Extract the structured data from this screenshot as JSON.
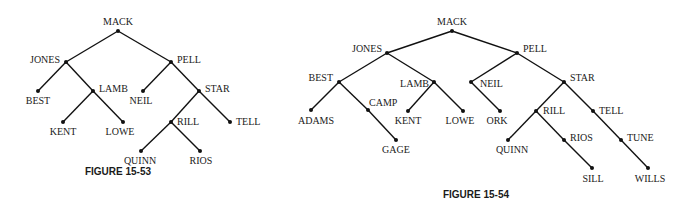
{
  "figures": [
    {
      "caption": "FIGURE 15-53",
      "caption_pos": [
        118,
        175
      ],
      "nodes": [
        {
          "id": "MACK",
          "x": 118,
          "y": 31,
          "lx": 118,
          "ly": 25,
          "anchor": "middle"
        },
        {
          "id": "JONES",
          "x": 66,
          "y": 62,
          "lx": 60,
          "ly": 63,
          "anchor": "end"
        },
        {
          "id": "PELL",
          "x": 171,
          "y": 62,
          "lx": 177,
          "ly": 63,
          "anchor": "start"
        },
        {
          "id": "BEST",
          "x": 38,
          "y": 91,
          "lx": 38,
          "ly": 104,
          "anchor": "middle"
        },
        {
          "id": "LAMB",
          "x": 93,
          "y": 91,
          "lx": 99,
          "ly": 92,
          "anchor": "start"
        },
        {
          "id": "NEIL",
          "x": 143,
          "y": 91,
          "lx": 141,
          "ly": 104,
          "anchor": "middle"
        },
        {
          "id": "STAR",
          "x": 199,
          "y": 91,
          "lx": 205,
          "ly": 92,
          "anchor": "start"
        },
        {
          "id": "KENT",
          "x": 63,
          "y": 122,
          "lx": 63,
          "ly": 135,
          "anchor": "middle"
        },
        {
          "id": "LOWE",
          "x": 123,
          "y": 122,
          "lx": 120,
          "ly": 135,
          "anchor": "middle"
        },
        {
          "id": "RILL",
          "x": 171,
          "y": 122,
          "lx": 177,
          "ly": 125,
          "anchor": "start"
        },
        {
          "id": "TELL",
          "x": 230,
          "y": 122,
          "lx": 236,
          "ly": 125,
          "anchor": "start"
        },
        {
          "id": "QUINN",
          "x": 141,
          "y": 151,
          "lx": 140,
          "ly": 164,
          "anchor": "middle"
        },
        {
          "id": "RIOS",
          "x": 200,
          "y": 151,
          "lx": 201,
          "ly": 164,
          "anchor": "middle"
        }
      ],
      "edges": [
        [
          "MACK",
          "JONES"
        ],
        [
          "MACK",
          "PELL"
        ],
        [
          "JONES",
          "BEST"
        ],
        [
          "JONES",
          "LAMB"
        ],
        [
          "LAMB",
          "KENT"
        ],
        [
          "LAMB",
          "LOWE"
        ],
        [
          "PELL",
          "NEIL"
        ],
        [
          "PELL",
          "STAR"
        ],
        [
          "STAR",
          "RILL"
        ],
        [
          "STAR",
          "TELL"
        ],
        [
          "RILL",
          "QUINN"
        ],
        [
          "RILL",
          "RIOS"
        ]
      ]
    },
    {
      "caption": "FIGURE 15-54",
      "caption_pos": [
        476,
        198
      ],
      "nodes": [
        {
          "id": "MACK",
          "x": 452,
          "y": 31,
          "lx": 452,
          "ly": 25,
          "anchor": "middle"
        },
        {
          "id": "JONES",
          "x": 387,
          "y": 53,
          "lx": 382,
          "ly": 52,
          "anchor": "end"
        },
        {
          "id": "PELL",
          "x": 517,
          "y": 53,
          "lx": 523,
          "ly": 52,
          "anchor": "start"
        },
        {
          "id": "BEST",
          "x": 339,
          "y": 82,
          "lx": 333,
          "ly": 81,
          "anchor": "end"
        },
        {
          "id": "LAMB",
          "x": 434,
          "y": 82,
          "lx": 429,
          "ly": 87,
          "anchor": "end"
        },
        {
          "id": "NEIL",
          "x": 471,
          "y": 82,
          "lx": 480,
          "ly": 87,
          "anchor": "start"
        },
        {
          "id": "STAR",
          "x": 564,
          "y": 82,
          "lx": 570,
          "ly": 81,
          "anchor": "start"
        },
        {
          "id": "ADAMS",
          "x": 311,
          "y": 110,
          "lx": 316,
          "ly": 124,
          "anchor": "middle"
        },
        {
          "id": "CAMP",
          "x": 368,
          "y": 110,
          "lx": 369,
          "ly": 106,
          "anchor": "start"
        },
        {
          "id": "KENT",
          "x": 408,
          "y": 111,
          "lx": 408,
          "ly": 124,
          "anchor": "middle"
        },
        {
          "id": "LOWE",
          "x": 463,
          "y": 111,
          "lx": 460,
          "ly": 124,
          "anchor": "middle"
        },
        {
          "id": "ORK",
          "x": 500,
          "y": 111,
          "lx": 497,
          "ly": 124,
          "anchor": "middle"
        },
        {
          "id": "RILL",
          "x": 536,
          "y": 111,
          "lx": 543,
          "ly": 114,
          "anchor": "start"
        },
        {
          "id": "TELL",
          "x": 593,
          "y": 111,
          "lx": 599,
          "ly": 114,
          "anchor": "start"
        },
        {
          "id": "GAGE",
          "x": 396,
          "y": 140,
          "lx": 396,
          "ly": 153,
          "anchor": "middle"
        },
        {
          "id": "QUINN",
          "x": 508,
          "y": 140,
          "lx": 512,
          "ly": 153,
          "anchor": "middle"
        },
        {
          "id": "RIOS",
          "x": 564,
          "y": 140,
          "lx": 570,
          "ly": 141,
          "anchor": "start"
        },
        {
          "id": "TUNE",
          "x": 621,
          "y": 140,
          "lx": 627,
          "ly": 141,
          "anchor": "start"
        },
        {
          "id": "SILL",
          "x": 592,
          "y": 168,
          "lx": 593,
          "ly": 182,
          "anchor": "middle"
        },
        {
          "id": "WILLS",
          "x": 648,
          "y": 168,
          "lx": 650,
          "ly": 182,
          "anchor": "middle"
        }
      ],
      "edges": [
        [
          "MACK",
          "JONES"
        ],
        [
          "MACK",
          "PELL"
        ],
        [
          "JONES",
          "BEST"
        ],
        [
          "JONES",
          "LAMB"
        ],
        [
          "BEST",
          "ADAMS"
        ],
        [
          "BEST",
          "CAMP"
        ],
        [
          "CAMP",
          "GAGE"
        ],
        [
          "LAMB",
          "KENT"
        ],
        [
          "LAMB",
          "LOWE"
        ],
        [
          "PELL",
          "NEIL"
        ],
        [
          "PELL",
          "STAR"
        ],
        [
          "NEIL",
          "ORK"
        ],
        [
          "STAR",
          "RILL"
        ],
        [
          "STAR",
          "TELL"
        ],
        [
          "RILL",
          "QUINN"
        ],
        [
          "RILL",
          "RIOS"
        ],
        [
          "RIOS",
          "SILL"
        ],
        [
          "TELL",
          "TUNE"
        ],
        [
          "TUNE",
          "WILLS"
        ]
      ]
    }
  ]
}
